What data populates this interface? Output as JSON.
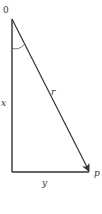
{
  "diagram": {
    "labels": {
      "origin": "0",
      "hypotenuse": "r",
      "vertical_leg": "x",
      "horizontal_leg": "y",
      "point": "p"
    },
    "colors": {
      "line": "#333333",
      "background": "#ffffff"
    }
  }
}
